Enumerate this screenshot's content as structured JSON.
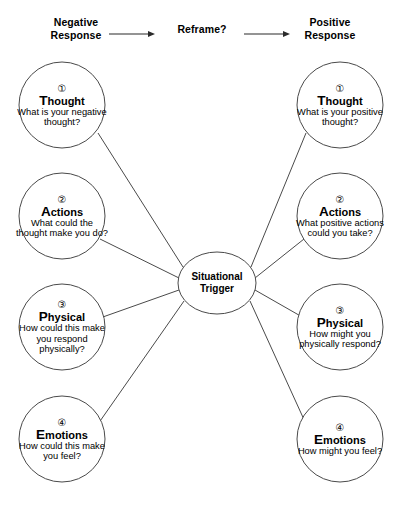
{
  "header": {
    "left_label": "Negative\nResponse",
    "left_label_line1": "Negative",
    "left_label_line2": "Response",
    "center_label": "Reframe?",
    "right_label_line1": "Positive",
    "right_label_line2": "Response",
    "arrow_glyph": "arrow-right-icon"
  },
  "center": {
    "line1": "Situational",
    "line2": "Trigger"
  },
  "colors": {
    "stroke": "#4a4a4a",
    "text": "#000000",
    "background": "#ffffff"
  },
  "left_column": [
    {
      "number": "①",
      "cap": "T",
      "rest": "hought",
      "question": "What is your negative thought?"
    },
    {
      "number": "②",
      "cap": "A",
      "rest": "ctions",
      "question": "What could the thought make you do?"
    },
    {
      "number": "③",
      "cap": "P",
      "rest": "hysical",
      "question": "How could this make you respond physically?"
    },
    {
      "number": "④",
      "cap": "E",
      "rest": "motions",
      "question": "How could this make you feel?"
    }
  ],
  "right_column": [
    {
      "number": "①",
      "cap": "T",
      "rest": "hought",
      "question": "What is your positive thought?"
    },
    {
      "number": "②",
      "cap": "A",
      "rest": "ctions",
      "question": "What positive actions could you take?"
    },
    {
      "number": "③",
      "cap": "P",
      "rest": "hysical",
      "question": "How might you physically respond?"
    },
    {
      "number": "④",
      "cap": "E",
      "rest": "motions",
      "question": "How might you feel?"
    }
  ]
}
